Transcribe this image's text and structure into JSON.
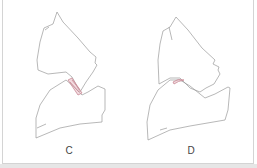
{
  "panels": [
    {
      "id": "C",
      "label": "C",
      "contact_highlight": "hatched wedge"
    },
    {
      "id": "D",
      "label": "D",
      "contact_highlight": "small crescent"
    }
  ],
  "colors": {
    "outline": "#9a9a9a",
    "highlight": "#c98a96",
    "label": "#444444",
    "border": "#d4d4d4"
  }
}
